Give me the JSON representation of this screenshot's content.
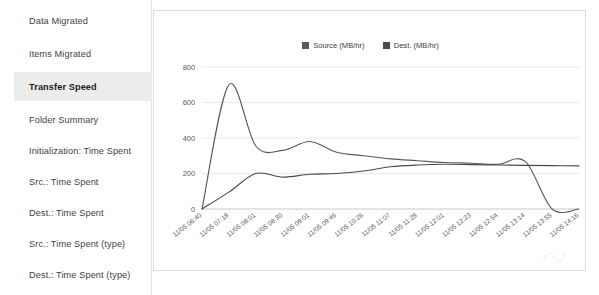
{
  "sidebar": {
    "items": [
      {
        "label": "Data Migrated",
        "active": false
      },
      {
        "label": "Items Migrated",
        "active": false
      },
      {
        "label": "Transfer Speed",
        "active": true
      },
      {
        "label": "Folder Summary",
        "active": false
      },
      {
        "label": "Initialization: Time Spent",
        "active": false
      },
      {
        "label": "Src.: Time Spent",
        "active": false
      },
      {
        "label": "Dest.: Time Spent",
        "active": false
      },
      {
        "label": "Src.: Time Spent (type)",
        "active": false
      },
      {
        "label": "Dest.: Time Spent (type)",
        "active": false
      }
    ]
  },
  "chart_data": {
    "type": "line",
    "title": "",
    "xlabel": "",
    "ylabel": "",
    "ylim": [
      0,
      800
    ],
    "yticks": [
      0,
      200,
      400,
      600,
      800
    ],
    "grid": true,
    "legend_position": "top-center",
    "colors": {
      "source": "#595959",
      "dest": "#4a4a4a"
    },
    "x": [
      "11/05 06:40",
      "11/05 07:18",
      "11/05 08:01",
      "11/05 08:30",
      "11/05 09:01",
      "11/05 09:46",
      "11/05 10:26",
      "11/05 11:07",
      "11/05 11:28",
      "11/05 12:01",
      "11/05 12:23",
      "11/05 12:54",
      "11/05 13:14",
      "11/05 13:55",
      "11/05 14:16"
    ],
    "series": [
      {
        "name": "Source (MB/hr)",
        "color": "#595959",
        "values": [
          0,
          700,
          355,
          330,
          380,
          320,
          300,
          282,
          272,
          262,
          258,
          252,
          268,
          0,
          0
        ]
      },
      {
        "name": "Dest. (MB/hr)",
        "color": "#4a4a4a",
        "values": [
          0,
          95,
          200,
          180,
          196,
          200,
          214,
          238,
          248,
          252,
          250,
          248,
          246,
          244,
          243
        ]
      }
    ]
  }
}
